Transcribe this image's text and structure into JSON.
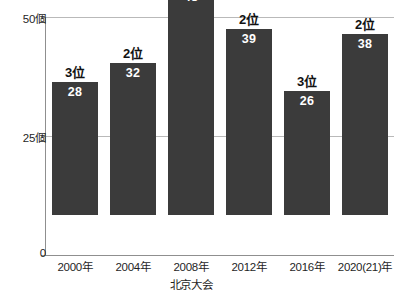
{
  "chart_data": {
    "type": "bar",
    "title": "",
    "xlabel": "",
    "ylabel": "",
    "categories": [
      "2000年",
      "2004年",
      "2008年",
      "2012年",
      "2016年",
      "2020(21)年"
    ],
    "category_sublabels": [
      "",
      "",
      "北京大会",
      "",
      "",
      ""
    ],
    "values": [
      28,
      32,
      48,
      39,
      26,
      38
    ],
    "point_labels": [
      "3位",
      "2位",
      "1位",
      "2位",
      "3位",
      "2位"
    ],
    "ylim": [
      0,
      50
    ],
    "yticks": [
      0,
      25,
      50
    ],
    "ytick_labels": [
      "0",
      "25個",
      "50個"
    ],
    "grid": true,
    "gridlines_at": [
      25,
      50
    ],
    "legend": "none",
    "bar_color": "#3b3b3b",
    "value_label_color": "#ffffff",
    "rank_label_color": "#121212",
    "grid_color": "#b9b9b9",
    "axis_color": "#8f8f8f",
    "background": "#ffffff"
  }
}
